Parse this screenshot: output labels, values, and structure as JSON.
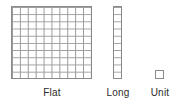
{
  "figure": {
    "title": "",
    "background_color": "#ffffff",
    "line_color": "#8a8a8a",
    "grid_line_color": "#9a9a9a",
    "label_color": "#2b2b2b"
  },
  "blocks": [
    {
      "id": "flat",
      "label": "Flat",
      "shape": "square-grid",
      "columns": 10,
      "rows": 10,
      "unit_count": 100
    },
    {
      "id": "long",
      "label": "Long",
      "shape": "vertical-rod",
      "columns": 1,
      "rows": 10,
      "unit_count": 10
    },
    {
      "id": "unit",
      "label": "Unit",
      "shape": "single-square",
      "columns": 1,
      "rows": 1,
      "unit_count": 1
    }
  ],
  "labels": {
    "flat": "Flat",
    "long": "Long",
    "unit": "Unit"
  }
}
